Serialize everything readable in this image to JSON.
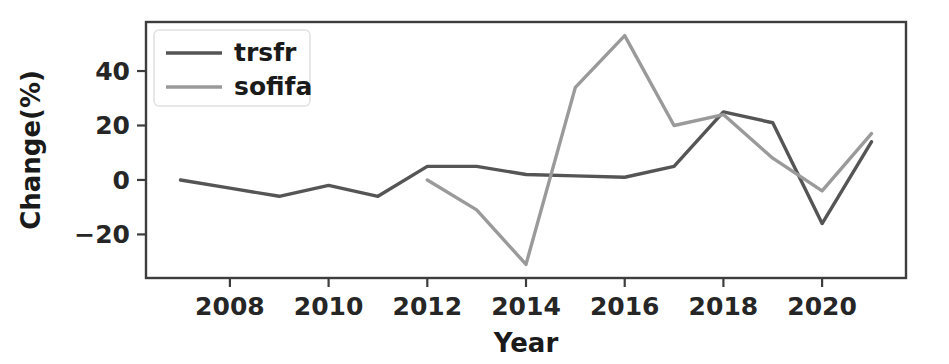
{
  "chart_data": {
    "type": "line",
    "title": "",
    "xlabel": "Year",
    "ylabel": "Change(%)",
    "x": [
      2007,
      2008,
      2009,
      2010,
      2011,
      2012,
      2013,
      2014,
      2015,
      2016,
      2017,
      2018,
      2019,
      2020,
      2021
    ],
    "xlim": [
      2006.3,
      2021.7
    ],
    "ylim": [
      -36,
      58
    ],
    "xticks": [
      2008,
      2010,
      2012,
      2014,
      2016,
      2018,
      2020
    ],
    "xtick_labels": [
      "2008",
      "2010",
      "2012",
      "2014",
      "2016",
      "2018",
      "2020"
    ],
    "yticks": [
      -20,
      0,
      20,
      40
    ],
    "ytick_labels": [
      "−20",
      "0",
      "20",
      "40"
    ],
    "grid": false,
    "legend_position": "upper left",
    "series": [
      {
        "name": "trsfr",
        "color": "#555555",
        "x": [
          2007,
          2008,
          2009,
          2010,
          2011,
          2012,
          2013,
          2014,
          2015,
          2016,
          2017,
          2018,
          2019,
          2020,
          2021
        ],
        "values": [
          0,
          -3,
          -6,
          -2,
          -6,
          5,
          5,
          2,
          1.5,
          1,
          5,
          25,
          21,
          -16,
          14
        ]
      },
      {
        "name": "sofifa",
        "color": "#9a9a9a",
        "x": [
          2012,
          2013,
          2014,
          2015,
          2016,
          2017,
          2018,
          2019,
          2020,
          2021
        ],
        "values": [
          0,
          -11,
          -31,
          34,
          53,
          20,
          24,
          8,
          -4,
          17
        ]
      }
    ]
  },
  "legend": {
    "entries": [
      {
        "label": "trsfr"
      },
      {
        "label": "sofifa"
      }
    ]
  },
  "axes": {
    "y_title": "Change(%)",
    "x_title": "Year"
  }
}
